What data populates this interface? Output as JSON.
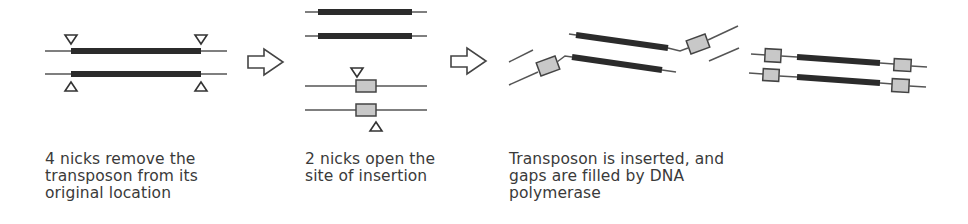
{
  "figure": {
    "colors": {
      "background": "#ffffff",
      "transposon": "#2b2b2b",
      "dna_strand": "#555555",
      "target_site_box": "#c8c8c8",
      "text": "#3a3a3a"
    },
    "panels": [
      {
        "id": "excision",
        "icons": [
          "nick-triangle-icon",
          "transposon-bar",
          "dna-strand"
        ],
        "caption_lines": [
          "4 nicks remove the",
          "transposon from its",
          "original location"
        ]
      },
      {
        "id": "target-site",
        "icons": [
          "nick-triangle-icon",
          "target-site-box",
          "dna-strand"
        ],
        "caption_lines": [
          "2 nicks open the",
          "site of insertion"
        ]
      },
      {
        "id": "insertion",
        "icons": [
          "transposon-bar",
          "target-site-box",
          "dna-strand"
        ],
        "caption_lines": [
          "Transposon is inserted, and",
          "gaps are filled by DNA",
          "polymerase"
        ]
      }
    ],
    "arrows": [
      "right-arrow-icon",
      "right-arrow-icon"
    ]
  }
}
